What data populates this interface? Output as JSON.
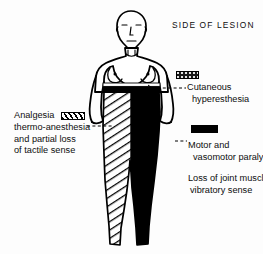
{
  "diagram": {
    "title": "SIDE OF LESION",
    "shading": {
      "hatched_side_label": "left-half-diagonal-hatching",
      "solid_side_label": "right-half-solid-black",
      "waist_band_label": "cutaneous-hyperesthesia-band"
    }
  },
  "annotations": {
    "cutaneous": {
      "swatch": "stippled-swatch",
      "line1": "Cutaneous",
      "line2": "hyperesthesia"
    },
    "analgesia": {
      "swatch": "hatched-swatch",
      "line1": "Analgesia",
      "line2": "thermo-anesthesia",
      "line3": "and partial loss",
      "line4": "of tactile sense"
    },
    "motor": {
      "swatch": "solid-black-swatch",
      "line1": "Motor and",
      "line2": "vasomotor paralysis"
    },
    "loss": {
      "line1": "Loss of joint muscle",
      "line2": "vibratory sense"
    }
  },
  "colors": {
    "ink": "#000000",
    "background": "#fdfdfd"
  }
}
